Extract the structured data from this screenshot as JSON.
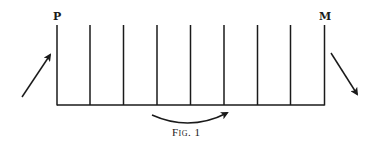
{
  "figure": {
    "caption": "Fig. 1",
    "labels": {
      "left_top": "P",
      "right_top": "M"
    },
    "ink_color": "#1a1a1a",
    "background": "#ffffff",
    "vertical_lines_count": 9,
    "elements": {
      "left_arrow": "arrow pointing up-right toward P",
      "right_arrow": "arrow pointing down-right away from M",
      "curved_arrow": "curved arrow under the baseline pointing right"
    }
  }
}
